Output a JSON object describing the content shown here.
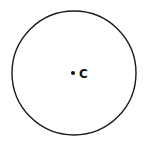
{
  "diagram": {
    "shape": "circle",
    "center": {
      "cx": 74,
      "cy": 73,
      "label": "C"
    },
    "radius": 62,
    "stroke_color": "#1a1a1a",
    "point_color": "#111111"
  }
}
